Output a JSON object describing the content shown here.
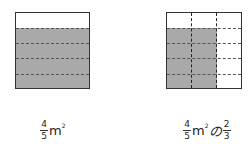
{
  "figures": [
    {
      "id": "left",
      "description": "Square of 1 m² divided into 5 horizontal strips, 4 shaded",
      "rows": 5,
      "shaded_rows": 4,
      "cols": 1,
      "shaded_cols": 1,
      "label": {
        "fraction": {
          "numerator": "4",
          "denominator": "5"
        },
        "unit": "m",
        "unit_exp": "2"
      }
    },
    {
      "id": "right",
      "description": "Square divided into 5 rows and 3 columns, 4 rows × 2 columns shaded",
      "rows": 5,
      "shaded_rows": 4,
      "cols": 3,
      "shaded_cols": 2,
      "label": {
        "fraction": {
          "numerator": "4",
          "denominator": "5"
        },
        "unit": "m",
        "unit_exp": "2",
        "particle": "の",
        "fraction2": {
          "numerator": "2",
          "denominator": "3"
        }
      }
    }
  ],
  "colors": {
    "shade": "#a9a9a9",
    "border": "#333333",
    "background": "#ffffff"
  }
}
